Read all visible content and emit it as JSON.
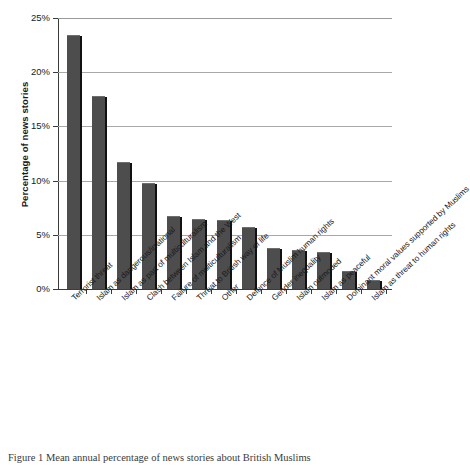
{
  "chart_data": {
    "type": "bar",
    "title": "",
    "xlabel": "",
    "ylabel": "Percentage of news stories",
    "ylim": [
      0,
      25
    ],
    "ytick_labels": [
      "0%",
      "5%",
      "10%",
      "15%",
      "20%",
      "25%"
    ],
    "ytick_values": [
      0,
      5,
      10,
      15,
      20,
      25
    ],
    "grid": "horizontal",
    "legend": "none",
    "bar_color": "#4d4d4d",
    "categories": [
      "Terrorist threat",
      "Islam as dangerous/irrational",
      "Islam as part of multiculturalism",
      "Clash between Islam and the West",
      "Failure of multiculturalism",
      "Threat to British way of life",
      "Other",
      "Defence of Muslim human rights",
      "Gender inequality",
      "Islam outmoded",
      "Islam as peaceful",
      "Dominant moral values supported by Muslims",
      "Islam as threat to human rights"
    ],
    "values": [
      23.4,
      17.8,
      11.7,
      9.8,
      6.7,
      6.5,
      6.4,
      5.7,
      3.8,
      3.6,
      3.4,
      1.7,
      0.8
    ]
  },
  "caption": {
    "text": "Figure 1 Mean annual percentage of news stories about British Muslims"
  },
  "axis": {
    "y_title": "Percentage of news stories"
  }
}
